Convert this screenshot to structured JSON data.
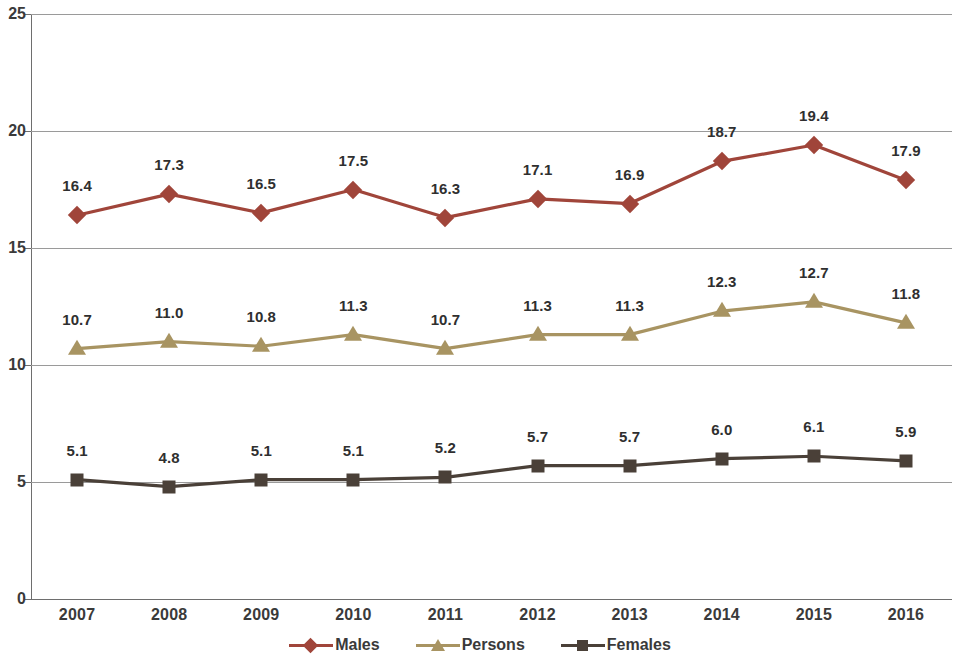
{
  "chart_data": {
    "type": "line",
    "title": "",
    "subtitle": "",
    "xlabel": "",
    "ylabel": "",
    "categories": [
      "2007",
      "2008",
      "2009",
      "2010",
      "2011",
      "2012",
      "2013",
      "2014",
      "2015",
      "2016"
    ],
    "ylim": [
      0,
      25
    ],
    "yticks": [
      "0",
      "5",
      "10",
      "15",
      "20",
      "25"
    ],
    "ytick_values": [
      0,
      5,
      10,
      15,
      20,
      25
    ],
    "grid": "horizontal",
    "legend_position": "bottom-center",
    "data_labels": true,
    "series": [
      {
        "name": "Males",
        "color": "#A0453A",
        "marker": "diamond",
        "values": [
          16.4,
          17.3,
          16.5,
          17.5,
          16.3,
          17.1,
          16.9,
          18.7,
          19.4,
          17.9
        ],
        "labels": [
          "16.4",
          "17.3",
          "16.5",
          "17.5",
          "16.3",
          "17.1",
          "16.9",
          "18.7",
          "19.4",
          "17.9"
        ]
      },
      {
        "name": "Persons",
        "color": "#A89462",
        "marker": "triangle",
        "values": [
          10.7,
          11.0,
          10.8,
          11.3,
          10.7,
          11.3,
          11.3,
          12.3,
          12.7,
          11.8
        ],
        "labels": [
          "10.7",
          "11.0",
          "10.8",
          "11.3",
          "10.7",
          "11.3",
          "11.3",
          "12.3",
          "12.7",
          "11.8"
        ]
      },
      {
        "name": "Females",
        "color": "#4A4038",
        "marker": "square",
        "values": [
          5.1,
          4.8,
          5.1,
          5.1,
          5.2,
          5.7,
          5.7,
          6.0,
          6.1,
          5.9
        ],
        "labels": [
          "5.1",
          "4.8",
          "5.1",
          "5.1",
          "5.2",
          "5.7",
          "5.7",
          "6.0",
          "6.1",
          "5.9"
        ]
      }
    ]
  },
  "legend": {
    "items": [
      {
        "label": "Males",
        "color": "#A0453A",
        "marker": "diamond"
      },
      {
        "label": "Persons",
        "color": "#A89462",
        "marker": "triangle"
      },
      {
        "label": "Females",
        "color": "#4A4038",
        "marker": "square"
      }
    ]
  },
  "axes": {
    "y_tick_labels": [
      "25",
      "20",
      "15",
      "10",
      "5",
      "0"
    ],
    "x_tick_labels": [
      "2007",
      "2008",
      "2009",
      "2010",
      "2011",
      "2012",
      "2013",
      "2014",
      "2015",
      "2016"
    ]
  },
  "colors": {
    "males": "#A0453A",
    "persons": "#A89462",
    "females": "#4A4038",
    "gridline": "#9a9a9a",
    "axis": "#6e6e6e",
    "text": "#3a3a3a",
    "background": "#ffffff"
  }
}
